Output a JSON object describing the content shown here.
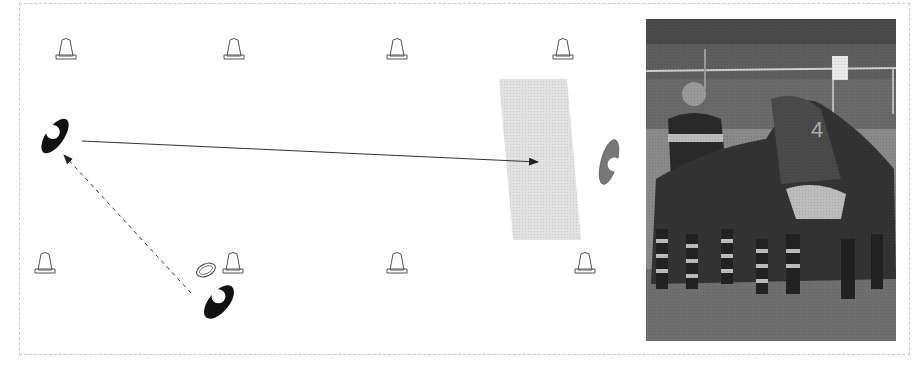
{
  "diagram": {
    "colors": {
      "frame": "#c8c8c8",
      "cone_stroke": "#555555",
      "attacker": "#111111",
      "defender": "#777777",
      "zone": "#dcdcdc",
      "arrow": "#333333"
    },
    "cones": [
      {
        "x": 66,
        "y": 52
      },
      {
        "x": 234,
        "y": 52
      },
      {
        "x": 397,
        "y": 52
      },
      {
        "x": 563,
        "y": 52
      },
      {
        "x": 45,
        "y": 266
      },
      {
        "x": 233,
        "y": 266
      },
      {
        "x": 397,
        "y": 266
      },
      {
        "x": 585,
        "y": 266
      }
    ],
    "players": [
      {
        "role": "attacker",
        "label": "receiver",
        "x": 55,
        "y": 135
      },
      {
        "role": "attacker",
        "label": "passer",
        "x": 219,
        "y": 301
      },
      {
        "role": "defender",
        "label": "defender",
        "x": 610,
        "y": 162
      }
    ],
    "ball": {
      "x": 205,
      "y": 270
    },
    "zone": {
      "label": "target-zone"
    },
    "arrows": [
      {
        "type": "run",
        "style": "solid"
      },
      {
        "type": "pass",
        "style": "dashed"
      }
    ]
  },
  "photo": {
    "caption": "Rugby maul photograph (black and white)"
  }
}
